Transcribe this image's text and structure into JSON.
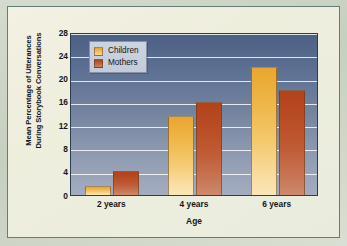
{
  "chart_data": {
    "type": "bar",
    "title": "",
    "xlabel": "Age",
    "ylabel": "Mean Percentage of Utterances During Storybook Conversations",
    "ylabel_lines": [
      "Mean Percentage of Utterances",
      "During Storybook Conversations"
    ],
    "categories": [
      "2 years",
      "4 years",
      "6 years"
    ],
    "series": [
      {
        "name": "Children",
        "color": "#eaa52e",
        "values": [
          1.6,
          13.6,
          22.0
        ]
      },
      {
        "name": "Mothers",
        "color": "#b2431d",
        "values": [
          4.2,
          15.9,
          18.0
        ]
      }
    ],
    "ylim": [
      0,
      28
    ],
    "yticks": [
      0,
      4,
      8,
      12,
      16,
      20,
      24,
      28
    ],
    "ytick_labels": [
      "0",
      "4",
      "8",
      "12",
      "16",
      "20",
      "24",
      "28"
    ],
    "grid": true,
    "legend_position": "top-left",
    "plot_background_top_color": "#4c6084",
    "plot_background_bottom_color": "#a4acbf",
    "gridline_color": "#ffffff",
    "page_background_color": "#f0efe0",
    "frame_border_color": "#5f7f77"
  }
}
